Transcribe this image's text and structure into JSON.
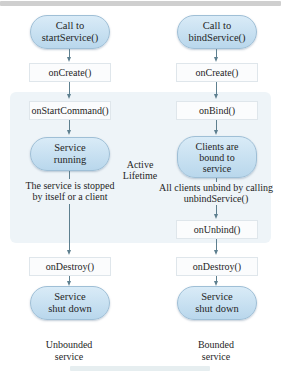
{
  "diagram": {
    "region": {
      "label_line1": "Active",
      "label_line2": "Lifetime"
    },
    "left_column": {
      "start": {
        "line1": "Call to",
        "line2": "startService()"
      },
      "on_create": "onCreate()",
      "on_start_command": "onStartCommand()",
      "running": {
        "line1": "Service",
        "line2": "running"
      },
      "stop_note": {
        "line1": "The service is stopped",
        "line2": "by itself or a client"
      },
      "on_destroy": "onDestroy()",
      "end": {
        "line1": "Service",
        "line2": "shut down"
      },
      "caption": {
        "line1": "Unbounded",
        "line2": "service"
      }
    },
    "right_column": {
      "start": {
        "line1": "Call to",
        "line2": "bindService()"
      },
      "on_create": "onCreate()",
      "on_bind": "onBind()",
      "bound": {
        "line1": "Clients are",
        "line2": "bound to",
        "line3": "service"
      },
      "unbind_note": {
        "line1": "All clients unbind by calling",
        "line2": "unbindService()"
      },
      "on_unbind": "onUnbind()",
      "on_destroy": "onDestroy()",
      "end": {
        "line1": "Service",
        "line2": "shut down"
      },
      "caption": {
        "line1": "Bounded",
        "line2": "service"
      }
    },
    "colors": {
      "pill_fill": "#c9e1f2",
      "pill_border": "#9fbfd6",
      "region_fill": "#eef4f8",
      "arrow": "#5d7f8f",
      "box_border": "#dfe6eb"
    }
  }
}
